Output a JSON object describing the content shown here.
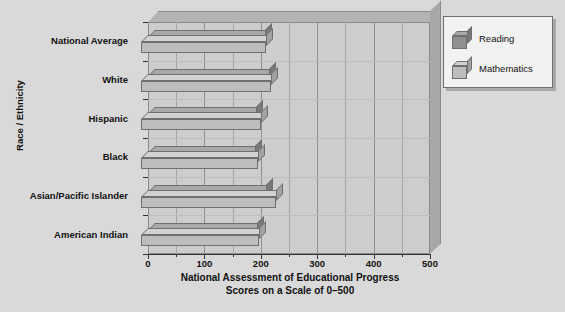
{
  "chart_data": {
    "type": "bar",
    "orientation": "horizontal",
    "title": "",
    "xlabel": "National Assessment of Educational Progress\nScores on a Scale of 0–500",
    "xlabel_line1": "National Assessment of Educational Progress",
    "xlabel_line2": "Scores on a Scale of 0–500",
    "ylabel": "Race / Ethnicity",
    "categories": [
      "National Average",
      "White",
      "Hispanic",
      "Black",
      "Asian/Pacific Islander",
      "American Indian"
    ],
    "series": [
      {
        "name": "Reading",
        "color": "#8f8f8f",
        "values": [
          207,
          214,
          192,
          190,
          210,
          193
        ]
      },
      {
        "name": "Mathematics",
        "color": "#bdbdbd",
        "values": [
          222,
          231,
          212,
          208,
          240,
          210
        ]
      }
    ],
    "xlim": [
      0,
      500
    ],
    "xticks": [
      0,
      100,
      200,
      300,
      400,
      500
    ],
    "xtick_labels": [
      "0",
      "100",
      "200",
      "300",
      "400",
      "500"
    ],
    "minor_tick_step": 50,
    "grid": true,
    "grid_axis": "x",
    "legend_position": "top-right",
    "style": "3d"
  },
  "legend": {
    "items": [
      {
        "label": "Reading"
      },
      {
        "label": "Mathematics"
      }
    ]
  },
  "colors": {
    "background": "#d9d9d9",
    "plot_wall": "#cdcdcd",
    "reading_front": "#8f8f8f",
    "math_front": "#bdbdbd",
    "gridline": "#a6a6a6",
    "axis": "#333333",
    "text": "#111111"
  }
}
